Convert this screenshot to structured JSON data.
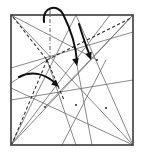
{
  "figure": {
    "paper_color": "#ffffff",
    "border_color": "#3a3a3a",
    "crease_color": "#6b6b6b",
    "dashed_color": "#2b2b2b",
    "arrow_color": "#111111",
    "axis_color": "#555555",
    "square": {
      "x": 11,
      "y": 15,
      "width": 122,
      "height": 130
    },
    "nodes": [
      {
        "name": "node-left",
        "x": 47,
        "y": 60
      },
      {
        "name": "node-upper-right",
        "x": 97,
        "y": 60
      },
      {
        "name": "node-center",
        "x": 76,
        "y": 105
      },
      {
        "name": "node-lower-right",
        "x": 106,
        "y": 108
      },
      {
        "name": "node-lower-left",
        "x": 45,
        "y": 107
      }
    ],
    "solid_creases": [
      {
        "name": "crease-tl-to-br",
        "x1": 11,
        "y1": 15,
        "x2": 133,
        "y2": 145
      },
      {
        "name": "crease-tr-to-bl",
        "x1": 133,
        "y1": 15,
        "x2": 11,
        "y2": 145
      },
      {
        "name": "crease-tl-to-node-left",
        "x1": 11,
        "y1": 15,
        "x2": 97,
        "y2": 60
      },
      {
        "name": "crease-tr-to-nodeleft",
        "x1": 133,
        "y1": 15,
        "x2": 45,
        "y2": 107
      },
      {
        "name": "crease-left-edge-fan-a",
        "x1": 11,
        "y1": 68,
        "x2": 133,
        "y2": 32
      },
      {
        "name": "crease-left-edge-fan-b",
        "x1": 11,
        "y1": 100,
        "x2": 133,
        "y2": 80
      },
      {
        "name": "crease-bl-to-top",
        "x1": 11,
        "y1": 145,
        "x2": 76,
        "y2": 15
      },
      {
        "name": "crease-bl-to-topright",
        "x1": 11,
        "y1": 145,
        "x2": 110,
        "y2": 15
      },
      {
        "name": "crease-br-to-top",
        "x1": 133,
        "y1": 145,
        "x2": 76,
        "y2": 15
      },
      {
        "name": "crease-br-to-left",
        "x1": 133,
        "y1": 145,
        "x2": 11,
        "y2": 88
      },
      {
        "name": "crease-bottom-up-mid",
        "x1": 62,
        "y1": 145,
        "x2": 106,
        "y2": 60
      },
      {
        "name": "crease-bottom-up-right",
        "x1": 92,
        "y1": 145,
        "x2": 76,
        "y2": 60
      },
      {
        "name": "crease-node-to-bottom",
        "x1": 47,
        "y1": 60,
        "x2": 76,
        "y2": 145
      },
      {
        "name": "crease-node-to-leftedge",
        "x1": 47,
        "y1": 60,
        "x2": 11,
        "y2": 83
      }
    ],
    "dashed_creases": [
      {
        "name": "dashed-tl-to-node",
        "x1": 13,
        "y1": 17,
        "x2": 47,
        "y2": 60
      },
      {
        "name": "dashed-node-to-bl",
        "x1": 47,
        "y1": 60,
        "x2": 12,
        "y2": 144
      },
      {
        "name": "dashed-node-to-upper-right",
        "x1": 47,
        "y1": 60,
        "x2": 131,
        "y2": 18
      },
      {
        "name": "dashed-node-down-right",
        "x1": 47,
        "y1": 60,
        "x2": 64,
        "y2": 100
      }
    ],
    "axis": {
      "name": "vertical-axis-dash-dot",
      "x": 50,
      "y1": 10,
      "y2": 60,
      "style": "dash-dot"
    },
    "arrows": [
      {
        "name": "fold-arrow-top-loop",
        "label": "fold over from top",
        "path": "M 44 22 C 42 6, 58 4, 63 14 C 70 28, 76 44, 77 62",
        "tip": {
          "x": 77,
          "y": 66,
          "angle": 78
        }
      },
      {
        "name": "fold-arrow-right",
        "label": "fold down on right",
        "path": "M 79 24 C 82 34, 86 46, 90 56",
        "tip": {
          "x": 91,
          "y": 60,
          "angle": 70
        }
      },
      {
        "name": "fold-arrow-left",
        "label": "fold toward center",
        "path": "M 19 77 C 32 70, 46 74, 56 84",
        "tip": {
          "x": 59,
          "y": 87,
          "angle": 42
        }
      }
    ]
  }
}
